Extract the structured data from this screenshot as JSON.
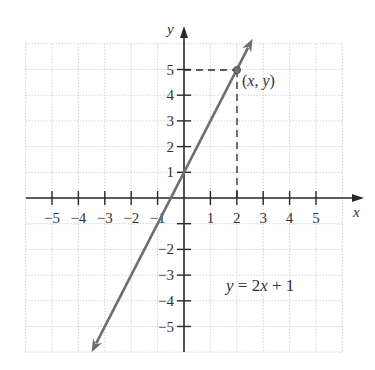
{
  "chart_data": {
    "type": "line",
    "title": "",
    "xlabel": "x",
    "ylabel": "y",
    "xlim": [
      -6,
      6
    ],
    "ylim": [
      -6,
      6
    ],
    "grid": true,
    "x_ticks": [
      -5,
      -4,
      -3,
      -2,
      -1,
      1,
      2,
      3,
      4,
      5
    ],
    "x_tick_labels": [
      "−5",
      "−4",
      "−3",
      "−2",
      "−1",
      "1",
      "2",
      "3",
      "4",
      "5"
    ],
    "y_ticks": [
      -5,
      -4,
      -3,
      -2,
      -1,
      1,
      2,
      3,
      4,
      5
    ],
    "y_tick_labels": [
      "−5",
      "−4",
      "−3",
      "−2",
      "",
      "1",
      "2",
      "3",
      "4",
      "5"
    ],
    "series": [
      {
        "name": "y = 2x + 1",
        "equation": "y = 2x + 1",
        "slope": 2,
        "intercept": 1,
        "x": [
          -3.5,
          2.6
        ],
        "y": [
          -6,
          6.2
        ],
        "color": "#6e6e6e"
      }
    ],
    "annotations": [
      {
        "type": "point",
        "x": 2,
        "y": 5,
        "label": "(x, y)"
      },
      {
        "type": "dashed-guide",
        "from": [
          0,
          5
        ],
        "to": [
          2,
          5
        ]
      },
      {
        "type": "dashed-guide",
        "from": [
          2,
          0
        ],
        "to": [
          2,
          5
        ]
      },
      {
        "type": "text",
        "text": "y = 2x + 1",
        "x": 3.5,
        "y": -3.6
      }
    ]
  },
  "labels": {
    "x_axis": "x",
    "y_axis": "y",
    "point": "(x, y)",
    "equation_y": "y",
    "equation_rest": " = 2",
    "equation_x": "x",
    "equation_tail": " + 1"
  },
  "colors": {
    "grid": "#c8c8c8",
    "axis": "#2a2a2a",
    "line": "#6e6e6e",
    "text": "#333333"
  }
}
